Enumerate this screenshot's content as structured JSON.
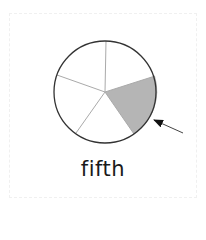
{
  "diagram": {
    "type": "fraction-pie",
    "total_slices": 5,
    "shaded_slices": 1,
    "shaded_index": 1,
    "shade_color": "#b5b5b5",
    "outline_color": "#333333",
    "spoke_color": "#aaaaaa",
    "pointer": "arrow pointing at shaded slice"
  },
  "label": {
    "text": "fifth"
  }
}
